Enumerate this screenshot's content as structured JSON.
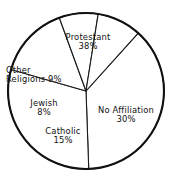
{
  "chart_data": {
    "type": "pie",
    "title": "",
    "subtitle": "",
    "xlabel": "",
    "ylabel": "",
    "legend": "none",
    "grid": false,
    "units": "percent",
    "total": 100,
    "categories": [
      "Protestant",
      "No Affiliation",
      "Catholic",
      "Jewish",
      "Other Religions"
    ],
    "values": [
      38,
      30,
      15,
      8,
      9
    ],
    "slices": [
      {
        "name": "Protestant",
        "value": 38,
        "value_label": "38%",
        "label_text": "Protestant",
        "start_angle_deg": 272,
        "end_angle_deg": 408,
        "color": "#ffffff",
        "stroke": "#1a1a1a"
      },
      {
        "name": "No Affiliation",
        "value": 30,
        "value_label": "30%",
        "label_text": "No Affiliation",
        "start_angle_deg": 164,
        "end_angle_deg": 272,
        "color": "#ffffff",
        "stroke": "#1a1a1a"
      },
      {
        "name": "Catholic",
        "value": 15,
        "value_label": "15%",
        "label_text": "Catholic",
        "start_angle_deg": 110,
        "end_angle_deg": 164,
        "color": "#ffffff",
        "stroke": "#1a1a1a"
      },
      {
        "name": "Jewish",
        "value": 8,
        "value_label": "8%",
        "label_text": "Jewish",
        "start_angle_deg": 81,
        "end_angle_deg": 110,
        "color": "#ffffff",
        "stroke": "#1a1a1a"
      },
      {
        "name": "Other Religions",
        "value": 9,
        "value_label": "9%",
        "label_text": "Other",
        "label_text_line2": "Religions 9%",
        "start_angle_deg": 48,
        "end_angle_deg": 81,
        "color": "#ffffff",
        "stroke": "#1a1a1a"
      }
    ],
    "geometry": {
      "center_x": 86,
      "center_y": 91,
      "radius": 78
    },
    "colors": {
      "slice_fill": "#ffffff",
      "outline": "#111111",
      "divider": "#1a1a1a",
      "text": "#111111",
      "background": "#ffffff"
    }
  }
}
